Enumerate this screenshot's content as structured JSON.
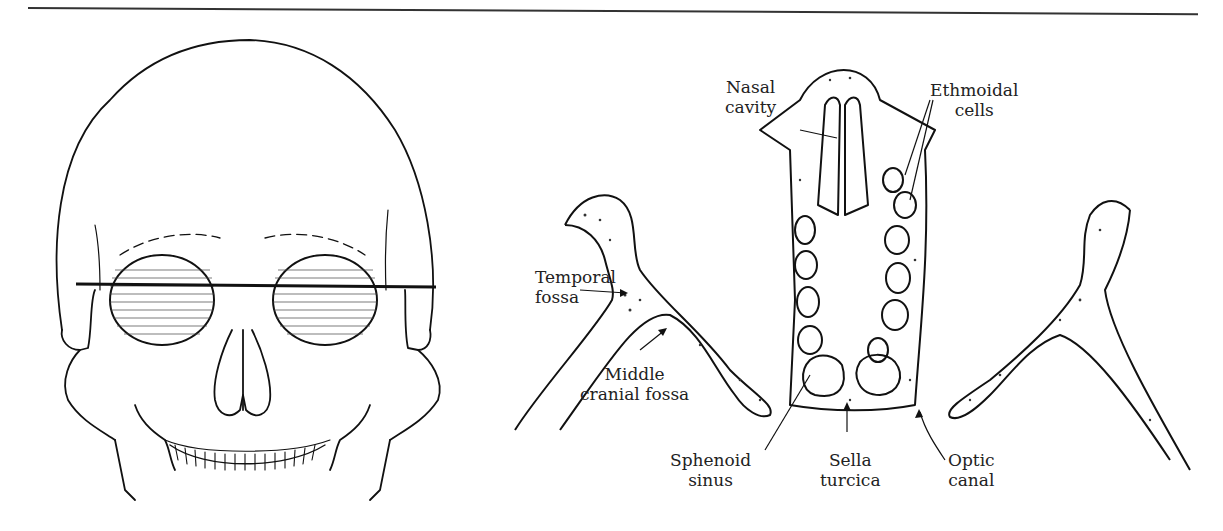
{
  "figure": {
    "type": "anatomical-diagram",
    "left_panel": {
      "subject": "Anterior view of skull with horizontal section line through orbits"
    },
    "right_panel": {
      "subject": "Horizontal section through orbits, nasal cavity and sphenoid",
      "labels": {
        "nasal_cavity": "Nasal\ncavity",
        "ethmoidal_cells": "Ethmoidal\ncells",
        "temporal_fossa": "Temporal\nfossa",
        "middle_cranial_fossa": "Middle\ncranial fossa",
        "sphenoid_sinus": "Sphenoid\nsinus",
        "sella_turcica": "Sella\nturcica",
        "optic_canal": "Optic\ncanal"
      }
    }
  }
}
